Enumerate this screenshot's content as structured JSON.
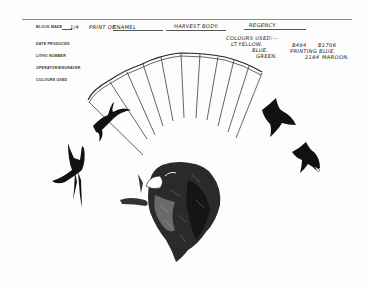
{
  "form": {
    "labels": {
      "block_made": "BLOCK MADE",
      "date_produced": "DATE PRODUCED",
      "litho_number": "LITHO NUMBER",
      "operator_engraver": "OPERATOR/ENGRAVER",
      "colours_used": "COLOURS USED"
    }
  },
  "handwriting": {
    "fraction": "1/4",
    "print_of": "PRINT OF",
    "enamel": "ENAMEL",
    "harvest_body": "HARVEST BODY.",
    "regency": "REGENCY.",
    "colours_used_heading": "COLOURS USED:—",
    "colour_1": "LT.YELLOW.",
    "colour_2": "BLUE.",
    "colour_3": "GREEN.",
    "code_1": "B464",
    "code_2": "B1706",
    "printing_blue": "PRINTING BLUE.",
    "code_3": "2164",
    "maroon": "MAROON."
  },
  "illustration": {
    "subjects": [
      "fan",
      "swallow-left-upper",
      "swallow-left-lower",
      "spaniel-dog-head",
      "swallow-right-upper",
      "swallow-right-lower"
    ],
    "ink_color": "#111111",
    "paper_color": "#fdfdfd"
  }
}
